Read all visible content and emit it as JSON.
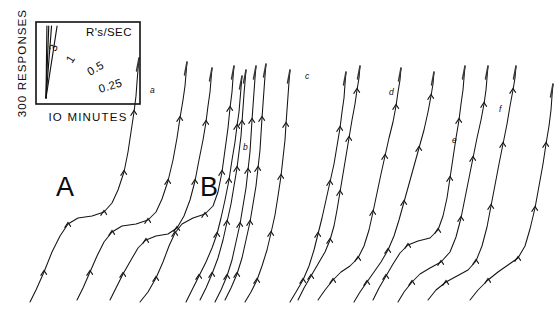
{
  "figure": {
    "type": "cumulative-record",
    "background_color": "#ffffff",
    "ink_color": "#141414",
    "width": 557,
    "height": 310
  },
  "legend": {
    "box": {
      "x": 36,
      "y": 22,
      "width": 104,
      "height": 82
    },
    "y_axis_label": "300 RESPONSES",
    "x_axis_label": "IO MINUTES",
    "rate_units_label": "R's/SEC",
    "rate_lines": [
      {
        "label": "3",
        "value": 3,
        "label_x": 56,
        "label_y": 52,
        "label_rot": -72
      },
      {
        "label": "1",
        "value": 1,
        "label_x": 72,
        "label_y": 64,
        "label_rot": -58
      },
      {
        "label": "0.5",
        "value": 0.5,
        "label_x": 90,
        "label_y": 76,
        "label_rot": -30
      },
      {
        "label": "0.25",
        "value": 0.25,
        "label_x": 100,
        "label_y": 93,
        "label_rot": -17
      }
    ]
  },
  "section_labels": [
    {
      "text": "A",
      "x": 56,
      "y": 196
    },
    {
      "text": "B",
      "x": 200,
      "y": 196
    }
  ],
  "point_labels": [
    {
      "text": "a",
      "x": 150,
      "y": 93
    },
    {
      "text": "b",
      "x": 243,
      "y": 150
    },
    {
      "text": "c",
      "x": 305,
      "y": 79
    },
    {
      "text": "d",
      "x": 389,
      "y": 95
    },
    {
      "text": "e",
      "x": 452,
      "y": 143
    },
    {
      "text": "f",
      "x": 499,
      "y": 112
    }
  ],
  "chart_data": {
    "type": "line",
    "title": "",
    "xlabel": "IO MINUTES",
    "ylabel": "300 RESPONSES",
    "grid": false,
    "legend_position": "top-left-inset",
    "legend_entries": [
      "3",
      "1",
      "0.5",
      "0.25"
    ],
    "annotations": [
      "A",
      "B",
      "a",
      "b",
      "c",
      "d",
      "e",
      "f"
    ],
    "series": [
      {
        "name": "A1",
        "points": "30,302 36,290 44,272 52,252 60,236 68,224 78,218 92,216 104,212 112,203 118,190 124,172 128,152 131,132 134,112 136,96 137,82 138,70 139,58"
      },
      {
        "name": "A2",
        "points": "77,300 83,288 90,272 97,256 104,242 112,232 122,226 136,224 148,220 156,212 162,199 168,181 173,160 177,138 180,118 183,100 185,86 186,74 187,62"
      },
      {
        "name": "A3",
        "points": "110,300 116,288 123,274 131,260 138,248 146,240 156,236 168,234 177,228 184,216 190,200 195,181 199,160 203,140 206,122 208,106 210,92 211,80 212,68"
      },
      {
        "name": "A4",
        "points": "140,302 148,292 156,278 163,262 169,246 175,233 182,224 193,218 205,214 213,206 218,192 222,172 225,150 228,128 230,108 232,92 233,78 234,66"
      },
      {
        "name": "B1",
        "points": "186,302 192,290 199,276 206,262 212,248 217,234 221,218 225,200 229,180 232,160 235,142 237,126 239,112 240,100 241,88 242,76"
      },
      {
        "name": "B2",
        "points": "200,300 206,288 212,274 218,258 223,240 227,222 231,204 234,186 237,168 239,152 241,136 242,122 243,108 244,94 245,82 246,70"
      },
      {
        "name": "B3",
        "points": "215,302 221,290 227,276 232,260 236,242 240,224 243,206 246,188 248,170 250,152 251,136 252,120 253,106 254,92 255,78 256,66"
      },
      {
        "name": "B4",
        "points": "225,300 231,288 237,274 242,258 246,240 250,222 253,204 256,186 258,168 260,150 261,134 262,118 263,104 264,90 265,76 266,64"
      },
      {
        "name": "B5",
        "points": "245,302 251,292 257,280 262,266 267,250 271,233 275,215 278,196 281,176 283,158 285,140 286,124 287,110 288,96 289,82 290,70"
      },
      {
        "name": "B6",
        "points": "290,302 296,292 303,280 309,266 314,250 318,234 322,218 326,200 330,182 334,164 337,146 340,128 342,112 344,98 345,84 346,72"
      },
      {
        "name": "C1",
        "points": "298,300 304,288 311,276 318,264 325,252 330,240 334,226 337,210 340,192 343,174 346,156 349,138 352,120 355,104 357,90 359,78 360,66"
      },
      {
        "name": "C2",
        "points": "318,300 325,290 333,280 341,272 350,266 358,258 364,246 369,230 373,212 377,193 381,174 385,156 389,138 393,122 396,106 398,92 400,80 401,68"
      },
      {
        "name": "C3",
        "points": "354,302 360,292 367,282 374,272 381,262 388,250 394,236 399,220 404,202 409,184 414,166 419,148 424,130 428,112 431,96 433,84 434,72"
      },
      {
        "name": "D1",
        "points": "373,300 379,288 386,276 393,264 400,253 408,245 418,241 430,238 438,230 443,216 447,198 450,178 453,158 456,138 459,120 461,104 463,90 464,78 465,66"
      },
      {
        "name": "D2",
        "points": "398,302 404,292 412,282 420,274 430,268 441,262 450,252 456,237 461,218 465,198 469,178 473,158 477,138 481,120 484,104 486,90 487,78 488,66"
      },
      {
        "name": "E1",
        "points": "428,300 436,290 446,282 457,276 468,270 476,261 482,246 487,227 491,206 495,185 499,164 503,144 507,124 510,106 513,90 515,78 516,66"
      },
      {
        "name": "F1",
        "points": "470,300 478,290 488,280 498,272 508,265 518,258 525,246 530,229 535,208 539,186 543,164 546,144 549,126 551,110 552,96 553,84"
      }
    ]
  }
}
